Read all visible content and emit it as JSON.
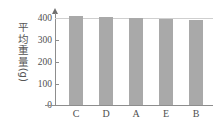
{
  "chart_data": {
    "type": "bar",
    "title": "",
    "subtitle": "",
    "xlabel": "",
    "ylabel": "平均重量（g）",
    "ylabel_chars": [
      "平",
      "均",
      "重",
      "量"
    ],
    "ylabel_unit": "(g)",
    "categories": [
      "C",
      "D",
      "A",
      "E",
      "B"
    ],
    "values": [
      415,
      410,
      405,
      400,
      397
    ],
    "ylim": [
      0,
      430
    ],
    "yticks": [
      0,
      100,
      200,
      300,
      400
    ],
    "ytick_labels": [
      "0",
      "100",
      "200",
      "300",
      "400"
    ],
    "grid": true,
    "gridlines_at": [
      400
    ],
    "legend": false,
    "legend_position": "none",
    "orientation": "vertical",
    "series": [
      {
        "name": "平均重量",
        "values": [
          415,
          410,
          405,
          400,
          397
        ]
      }
    ]
  },
  "style": {
    "bar_color": "#a9a9a9",
    "axis_color": "#8d8d8d",
    "gridline_color": "#cfcfcf",
    "text_color": "#4f4f4f",
    "background": "#ffffff"
  }
}
